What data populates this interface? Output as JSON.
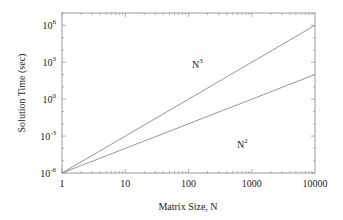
{
  "chart_data": {
    "type": "line",
    "title": "",
    "xlabel": "Matrix Size, N",
    "ylabel": "Solution Time (sec)",
    "xscale": "log",
    "yscale": "log",
    "xlim": [
      1,
      10000
    ],
    "ylim": [
      1e-06,
      10000000.0
    ],
    "grid": false,
    "legend": "none (inline annotations)",
    "x_ticks": [
      "1",
      "10",
      "100",
      "1000",
      "10000"
    ],
    "y_ticks": [
      {
        "base": "10",
        "exp": "6"
      },
      {
        "base": "10",
        "exp": "3"
      },
      {
        "base": "10",
        "exp": "0"
      },
      {
        "base": "10",
        "exp": "-3"
      },
      {
        "base": "10",
        "exp": "-6"
      }
    ],
    "x": [
      1,
      10,
      100,
      1000,
      10000
    ],
    "series": [
      {
        "name": "N^3",
        "label_base": "N",
        "label_exp": "3",
        "values": [
          1e-06,
          0.001,
          1,
          1000.0,
          1000000.0
        ]
      },
      {
        "name": "N^2",
        "label_base": "N",
        "label_exp": "2",
        "values": [
          1e-06,
          0.0001,
          0.01,
          1,
          100.0
        ]
      }
    ],
    "line_color": "#8a8a8a",
    "axis_color": "#9a9a9a"
  }
}
